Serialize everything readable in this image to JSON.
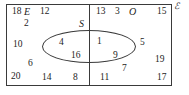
{
  "diagram": {
    "universal_set_symbol": "ℰ",
    "set_labels": {
      "even": "E",
      "odd": "O",
      "squares": "S"
    },
    "regions": {
      "even_only": [
        18,
        12,
        2,
        10,
        6,
        20,
        14,
        8
      ],
      "even_and_square": [
        4,
        16
      ],
      "odd_only": [
        13,
        3,
        15,
        5,
        19,
        7,
        11,
        17
      ],
      "odd_and_square": [
        1,
        9
      ]
    },
    "placed_items": [
      {
        "name": "even-set-label",
        "text": "E",
        "x": 24,
        "y": 7,
        "kind": "set-label"
      },
      {
        "name": "odd-set-label",
        "text": "O",
        "x": 129,
        "y": 7,
        "kind": "set-label"
      },
      {
        "name": "squares-set-label",
        "text": "S",
        "x": 79,
        "y": 19,
        "kind": "set-label"
      },
      {
        "name": "number-18",
        "text": "18",
        "x": 12,
        "y": 7,
        "kind": "number"
      },
      {
        "name": "number-12",
        "text": "12",
        "x": 40,
        "y": 7,
        "kind": "number"
      },
      {
        "name": "number-2",
        "text": "2",
        "x": 24,
        "y": 19,
        "kind": "number"
      },
      {
        "name": "number-10",
        "text": "10",
        "x": 13,
        "y": 40,
        "kind": "number"
      },
      {
        "name": "number-6",
        "text": "6",
        "x": 28,
        "y": 59,
        "kind": "number"
      },
      {
        "name": "number-20",
        "text": "20",
        "x": 11,
        "y": 72,
        "kind": "number"
      },
      {
        "name": "number-14",
        "text": "14",
        "x": 42,
        "y": 73,
        "kind": "number"
      },
      {
        "name": "number-8",
        "text": "8",
        "x": 73,
        "y": 73,
        "kind": "number"
      },
      {
        "name": "number-4",
        "text": "4",
        "x": 59,
        "y": 38,
        "kind": "number"
      },
      {
        "name": "number-16",
        "text": "16",
        "x": 71,
        "y": 51,
        "kind": "number"
      },
      {
        "name": "number-1",
        "text": "1",
        "x": 97,
        "y": 37,
        "kind": "number"
      },
      {
        "name": "number-9",
        "text": "9",
        "x": 113,
        "y": 51,
        "kind": "number"
      },
      {
        "name": "number-13",
        "text": "13",
        "x": 96,
        "y": 7,
        "kind": "number"
      },
      {
        "name": "number-3",
        "text": "3",
        "x": 115,
        "y": 7,
        "kind": "number"
      },
      {
        "name": "number-15",
        "text": "15",
        "x": 157,
        "y": 7,
        "kind": "number"
      },
      {
        "name": "number-5",
        "text": "5",
        "x": 140,
        "y": 38,
        "kind": "number"
      },
      {
        "name": "number-19",
        "text": "19",
        "x": 155,
        "y": 55,
        "kind": "number"
      },
      {
        "name": "number-7",
        "text": "7",
        "x": 122,
        "y": 64,
        "kind": "number"
      },
      {
        "name": "number-11",
        "text": "11",
        "x": 100,
        "y": 73,
        "kind": "number"
      },
      {
        "name": "number-17",
        "text": "17",
        "x": 157,
        "y": 73,
        "kind": "number"
      }
    ]
  },
  "colors": {
    "stroke": "#3a3a3a",
    "text": "#1c1c1c",
    "background": "#ffffff"
  }
}
